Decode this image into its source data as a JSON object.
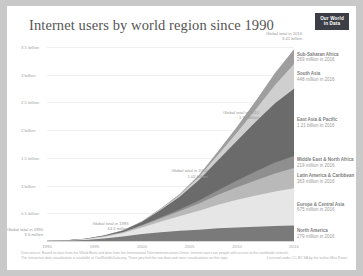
{
  "header": {
    "title": "Internet users by world region since 1990",
    "logo_line1": "Our World",
    "logo_line2": "in Data"
  },
  "footer": {
    "line1": "Data source: Based on data from the World Bank and data from the International Telecommunications Union. Internet users are people with access to the worldwide network.",
    "line2": "The interactive data visualization is available at OurWorldInData.org. There you find the raw data and more visualizations on this topic.",
    "license": "Licensed under CC-BY-SA by the author Max Roser."
  },
  "chart_data": {
    "type": "area",
    "stacked": true,
    "title": "Internet users by world region since 1990",
    "xlabel": "",
    "ylabel": "",
    "xlim": [
      1990,
      2016
    ],
    "ylim": [
      0,
      3700000000
    ],
    "grid": true,
    "legend_position": "inline-right",
    "x_ticks": [
      "1990",
      "1995",
      "2000",
      "2005",
      "2010",
      "2016"
    ],
    "x_tick_values": [
      1990,
      1995,
      2000,
      2005,
      2010,
      2016
    ],
    "y_ticks": [
      "3.5 billion",
      "3 billion",
      "2.5 billion",
      "2 billion",
      "1.5 billion",
      "1 billion",
      "0.5 billion"
    ],
    "y_tick_values": [
      3500000000,
      3000000000,
      2500000000,
      2000000000,
      1500000000,
      1000000000,
      500000000
    ],
    "x": [
      1990,
      1992,
      1994,
      1996,
      1998,
      2000,
      2002,
      2004,
      2006,
      2008,
      2010,
      2012,
      2014,
      2016
    ],
    "series": [
      {
        "name": "North America",
        "label": "North America",
        "value_label": "279 million in 2016",
        "color": "#7a7a7a",
        "values": [
          2000000,
          7000000,
          20000000,
          45000000,
          82000000,
          125000000,
          160000000,
          185000000,
          205000000,
          228000000,
          245000000,
          258000000,
          270000000,
          279000000
        ]
      },
      {
        "name": "Europe & Central Asia",
        "label": "Europe & Central Asia",
        "value_label": "675 million in 2016",
        "color": "#e6e6e6",
        "values": [
          1000000,
          4000000,
          13000000,
          33000000,
          62000000,
          120000000,
          190000000,
          265000000,
          340000000,
          425000000,
          500000000,
          565000000,
          625000000,
          675000000
        ]
      },
      {
        "name": "Latin America & Caribbean",
        "label": "Latin America & Caribbean",
        "value_label": "363 million in 2016",
        "color": "#b9b9b9",
        "values": [
          200000,
          800000,
          3000000,
          8000000,
          16000000,
          33000000,
          62000000,
          90000000,
          130000000,
          180000000,
          225000000,
          275000000,
          325000000,
          363000000
        ]
      },
      {
        "name": "Middle East & North Africa",
        "label": "Middle East & North Africa",
        "value_label": "219 million in 2016",
        "color": "#8f8f8f",
        "values": [
          50000,
          200000,
          700000,
          2000000,
          4500000,
          9000000,
          18000000,
          32000000,
          55000000,
          85000000,
          120000000,
          160000000,
          195000000,
          219000000
        ]
      },
      {
        "name": "East Asia & Pacific",
        "label": "East Asia & Pacific",
        "value_label": "1.21 billion in 2016",
        "color": "#6b6b6b",
        "values": [
          300000,
          1200000,
          4000000,
          11000000,
          26000000,
          60000000,
          135000000,
          230000000,
          370000000,
          540000000,
          720000000,
          900000000,
          1070000000,
          1210000000
        ]
      },
      {
        "name": "South Asia",
        "label": "South Asia",
        "value_label": "448 million in 2016",
        "color": "#cfcfcf",
        "values": [
          20000,
          80000,
          300000,
          900000,
          2500000,
          6000000,
          16000000,
          32000000,
          60000000,
          100000000,
          150000000,
          225000000,
          330000000,
          448000000
        ]
      },
      {
        "name": "Sub-Saharan Africa",
        "label": "Sub-Saharan Africa",
        "value_label": "269 million in 2016",
        "color": "#9e9e9e",
        "values": [
          10000,
          40000,
          150000,
          500000,
          1500000,
          4000000,
          9000000,
          18000000,
          33000000,
          60000000,
          100000000,
          155000000,
          215000000,
          269000000
        ]
      }
    ],
    "annotations": [
      {
        "id": "m1990",
        "label": "Global total in 1990",
        "value": "3.5 million",
        "year": 1990
      },
      {
        "id": "m1995",
        "label": "Global total in 1995",
        "value": "44.5 million",
        "year": 1995
      },
      {
        "id": "m2000",
        "label": "Global total in 2000",
        "value": "1.02 billion",
        "year": 2005
      },
      {
        "id": "m2010",
        "label": "Global total in 2010",
        "value": "1.99 billion",
        "year": 2010
      },
      {
        "id": "m2016",
        "label": "Global total in 2016",
        "value": "3.41 billion",
        "year": 2016
      }
    ]
  }
}
